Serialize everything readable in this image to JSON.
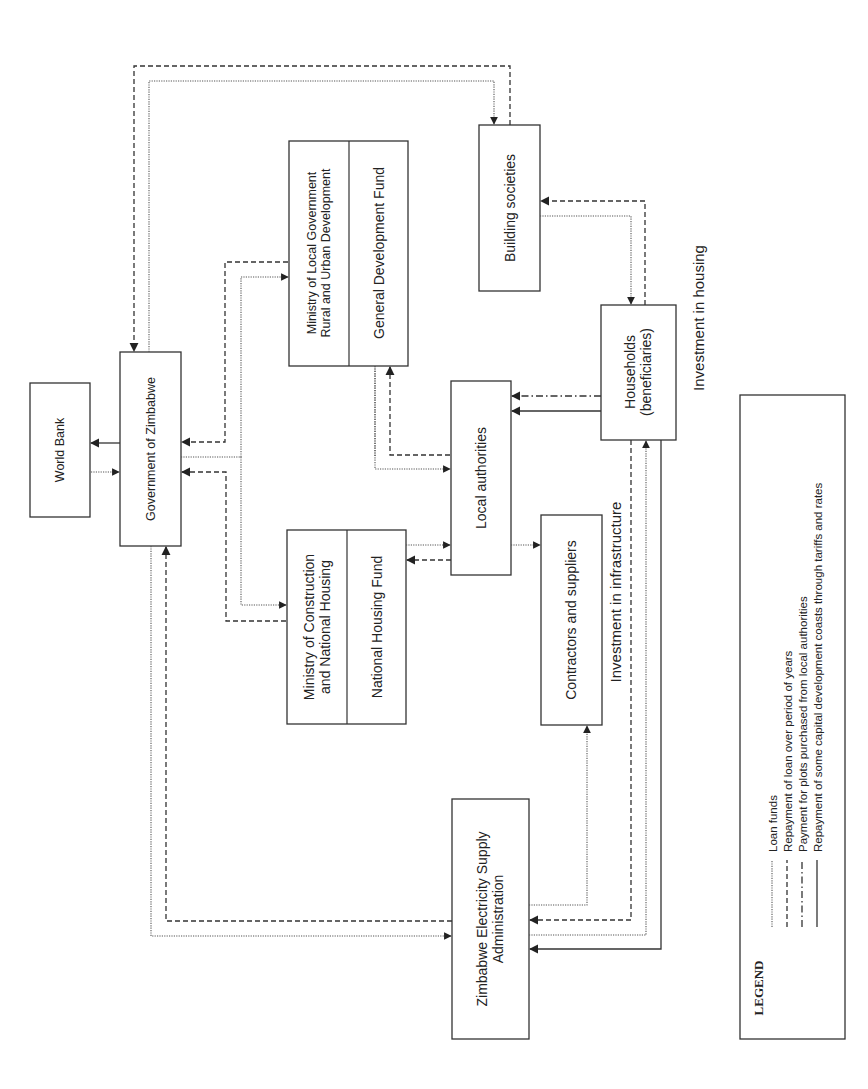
{
  "nodes": {
    "world_bank": "World Bank",
    "government": "Government of Zimbabwe",
    "ministry_local_gov": "Ministry of Local Government\nRural and Urban Development",
    "ministry_local_gov_line1": "Ministry of Local Government",
    "ministry_local_gov_line2": "Rural and Urban Development",
    "general_development_fund": "General Development Fund",
    "ministry_construction_line1": "Ministry of Construction",
    "ministry_construction_line2": "and National Housing",
    "national_housing_fund": "National Housing Fund",
    "building_societies": "Building societies",
    "households_line1": "Households",
    "households_line2": "(beneficiaries)",
    "local_authorities": "Local authorities",
    "contractors": "Contractors and suppliers",
    "zesa_line1": "Zimbabwe Electricity Supply",
    "zesa_line2": "Administration"
  },
  "annotations": {
    "investment_housing": "Investment in housing",
    "investment_infrastructure": "Investment in infrastructure"
  },
  "legend": {
    "title": "LEGEND",
    "items": [
      {
        "style": "dotted",
        "label": "Loan funds"
      },
      {
        "style": "dashed",
        "label": "Repayment of loan over period of years"
      },
      {
        "style": "dash-dot",
        "label": "Payment for plots purchased from local authorities"
      },
      {
        "style": "solid",
        "label": "Repayment of some capital development coasts through tariffs and rates"
      }
    ]
  },
  "edges": [
    {
      "from": "Government of Zimbabwe",
      "to": "World Bank",
      "type": "solid"
    },
    {
      "from": "World Bank",
      "to": "Government of Zimbabwe",
      "type": "dotted"
    },
    {
      "from": "Government of Zimbabwe",
      "to": "Building societies",
      "type": "dotted"
    },
    {
      "from": "Building societies",
      "to": "Government of Zimbabwe",
      "type": "dashed"
    },
    {
      "from": "Government of Zimbabwe",
      "to": "Ministry of Local Government",
      "type": "dotted"
    },
    {
      "from": "Ministry of Local Government",
      "to": "Government of Zimbabwe",
      "type": "dashed"
    },
    {
      "from": "Government of Zimbabwe",
      "to": "Ministry of Construction",
      "type": "dotted"
    },
    {
      "from": "Ministry of Construction",
      "to": "Government of Zimbabwe",
      "type": "dashed"
    },
    {
      "from": "General Development Fund",
      "to": "Local authorities",
      "type": "dotted"
    },
    {
      "from": "Local authorities",
      "to": "General Development Fund",
      "type": "dashed"
    },
    {
      "from": "National Housing Fund",
      "to": "Local authorities",
      "type": "dotted"
    },
    {
      "from": "Local authorities",
      "to": "National Housing Fund",
      "type": "dashed"
    },
    {
      "from": "Local authorities",
      "to": "Contractors and suppliers",
      "type": "dotted"
    },
    {
      "from": "Building societies",
      "to": "Households",
      "type": "dotted"
    },
    {
      "from": "Households",
      "to": "Building societies",
      "type": "dashed"
    },
    {
      "from": "Households",
      "to": "Local authorities",
      "type": "dash-dot"
    },
    {
      "from": "Households",
      "to": "Local authorities",
      "type": "solid"
    },
    {
      "from": "Government of Zimbabwe",
      "to": "ZESA",
      "type": "dotted"
    },
    {
      "from": "ZESA",
      "to": "Government of Zimbabwe",
      "type": "dashed"
    },
    {
      "from": "ZESA",
      "to": "Contractors and suppliers",
      "type": "dotted"
    },
    {
      "from": "Households",
      "to": "ZESA",
      "type": "dashed"
    },
    {
      "from": "ZESA",
      "to": "Households",
      "type": "dotted"
    },
    {
      "from": "Households",
      "to": "ZESA",
      "type": "solid"
    }
  ]
}
